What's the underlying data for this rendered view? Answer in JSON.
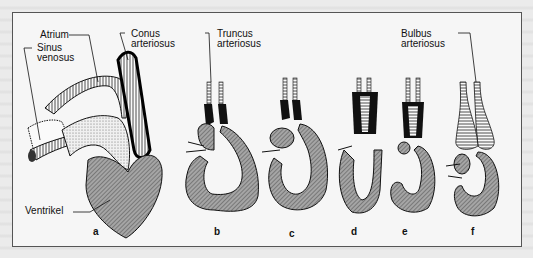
{
  "figure": {
    "labels": {
      "atrium": "Atrium",
      "sinus_venosus_1": "Sinus",
      "sinus_venosus_2": "venosus",
      "conus_1": "Conus",
      "conus_2": "arteriosus",
      "truncus_1": "Truncus",
      "truncus_2": "arteriosus",
      "bulbus_1": "Bulbus",
      "bulbus_2": "arteriosus",
      "ventrikel": "Ventrikel"
    },
    "stages": [
      "a",
      "b",
      "c",
      "d",
      "e",
      "f"
    ],
    "colors": {
      "frame": "#555555",
      "panel_bg": "#f6f6f6",
      "page_bg": "#ebebeb",
      "ventricle_fill": "#8c8c8c",
      "ink": "#111111"
    }
  }
}
